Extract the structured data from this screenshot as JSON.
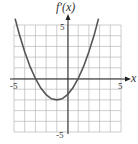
{
  "chart_data": {
    "type": "line",
    "title": "f'(x)",
    "xlabel": "x",
    "ylabel": "f'(x)",
    "xlim": [
      -5,
      5
    ],
    "ylim": [
      -5,
      5
    ],
    "grid": true,
    "x_tick_labels": [
      "-5",
      "5"
    ],
    "y_tick_labels": [
      "5",
      "-5"
    ],
    "series": [
      {
        "name": "f'(x)",
        "description": "upward parabola, roots at x=-3 and x=1, vertex at (-1,-2)",
        "x": [
          -4.9,
          -4.5,
          -4,
          -3.5,
          -3,
          -2.5,
          -2,
          -1.5,
          -1,
          -0.5,
          0,
          0.5,
          1,
          1.5,
          2,
          2.5,
          2.9
        ],
        "values": [
          5.6,
          4.1,
          2.5,
          1.1,
          0,
          -0.9,
          -1.5,
          -1.9,
          -2,
          -1.9,
          -1.5,
          -0.9,
          0,
          1.1,
          2.5,
          4.1,
          5.6
        ]
      }
    ]
  }
}
